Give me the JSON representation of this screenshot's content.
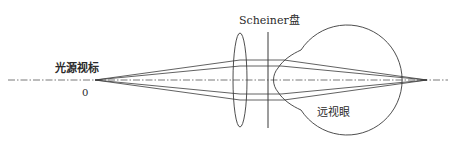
{
  "diagram": {
    "labels": {
      "source": "光源视标",
      "source_position": "0",
      "scheiner_disc": "Scheiner盘",
      "eye": "远视眼"
    },
    "colors": {
      "line": "#3a3a3a",
      "axis": "#555555",
      "background": "#ffffff"
    },
    "elements": [
      {
        "type": "optical-axis",
        "style": "dash-dot"
      },
      {
        "type": "point-source",
        "label_ref": "source"
      },
      {
        "type": "convex-lens"
      },
      {
        "type": "scheiner-disc",
        "label_ref": "scheiner_disc"
      },
      {
        "type": "eyeball",
        "label_ref": "eye"
      },
      {
        "type": "ray-bundle",
        "count": 4
      }
    ]
  }
}
